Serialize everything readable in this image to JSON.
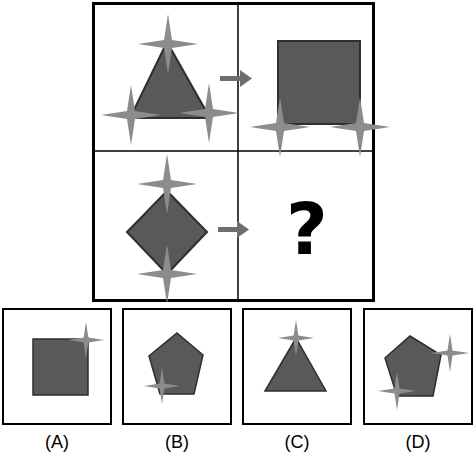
{
  "puzzle": {
    "title": "Analogy shape puzzle",
    "colors": {
      "shape_fill": "#595959",
      "shape_stroke": "#333333",
      "star_fill": "#8c8c8c",
      "arrow": "#6e6e6e",
      "border": "#000000"
    },
    "question_mark": "?",
    "cells": [
      {
        "position": "top-left",
        "shape": "triangle",
        "stars": 3,
        "star_positions": [
          "top-vertex",
          "bottom-left-vertex",
          "bottom-right-vertex"
        ]
      },
      {
        "position": "top-right",
        "shape": "square",
        "stars": 2,
        "star_positions": [
          "bottom-left-corner",
          "bottom-right-corner"
        ]
      },
      {
        "position": "bottom-left",
        "shape": "diamond",
        "stars": 2,
        "star_positions": [
          "top-vertex",
          "bottom-vertex"
        ]
      },
      {
        "position": "bottom-right",
        "shape": "question-mark",
        "stars": 0
      }
    ]
  },
  "options": [
    {
      "label": "(A)",
      "shape": "square",
      "stars": 1,
      "star_positions": [
        "top-right-corner"
      ]
    },
    {
      "label": "(B)",
      "shape": "pentagon",
      "stars": 1,
      "star_positions": [
        "bottom-left-vertex"
      ]
    },
    {
      "label": "(C)",
      "shape": "triangle",
      "stars": 1,
      "star_positions": [
        "top-vertex"
      ]
    },
    {
      "label": "(D)",
      "shape": "pentagon",
      "stars": 2,
      "star_positions": [
        "upper-right",
        "bottom-left-vertex"
      ]
    }
  ]
}
